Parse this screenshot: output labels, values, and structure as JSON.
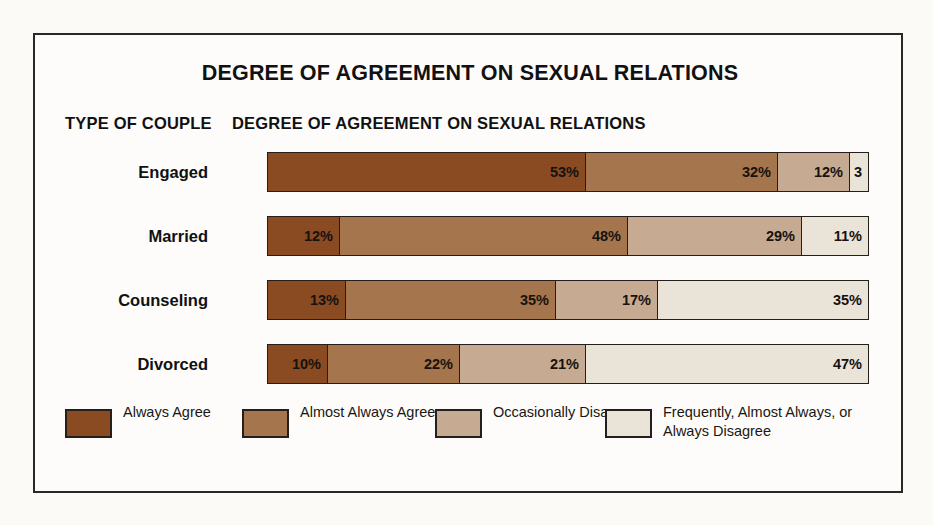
{
  "chart_data": {
    "type": "bar",
    "orientation": "horizontal",
    "stacked": true,
    "normalized_percent": true,
    "title": "DEGREE OF AGREEMENT ON SEXUAL RELATIONS",
    "xlabel": "DEGREE OF AGREEMENT ON SEXUAL RELATIONS",
    "ylabel": "TYPE OF COUPLE",
    "grid": false,
    "legend_position": "bottom",
    "xlim": [
      0,
      100
    ],
    "categories": [
      "Engaged",
      "Married",
      "Counseling",
      "Divorced"
    ],
    "series": [
      {
        "name": "Always Agree",
        "color": "#8a4a22",
        "values": [
          53,
          12,
          13,
          10
        ],
        "labels": [
          "53%",
          "12%",
          "13%",
          "10%"
        ]
      },
      {
        "name": "Almost Always Agree",
        "color": "#a5754d",
        "values": [
          32,
          48,
          35,
          22
        ],
        "labels": [
          "32%",
          "48%",
          "35%",
          "22%"
        ]
      },
      {
        "name": "Occasionally Disagree",
        "color": "#c6ab92",
        "values": [
          12,
          29,
          17,
          21
        ],
        "labels": [
          "12%",
          "29%",
          "17%",
          "21%"
        ]
      },
      {
        "name": "Frequently, Almost Always, or Always Disagree",
        "color": "#e9e3d8",
        "values": [
          3,
          11,
          35,
          47
        ],
        "labels": [
          "3",
          "11%",
          "35%",
          "47%"
        ]
      }
    ]
  },
  "header": {
    "title": "DEGREE OF AGREEMENT ON SEXUAL RELATIONS",
    "col_label_left": "TYPE OF COUPLE",
    "col_label_right": "DEGREE OF AGREEMENT ON SEXUAL RELATIONS"
  },
  "rows": [
    {
      "label": "Engaged",
      "segments": [
        {
          "label": "53%",
          "value": 53,
          "color": "#8a4a22"
        },
        {
          "label": "32%",
          "value": 32,
          "color": "#a5754d"
        },
        {
          "label": "12%",
          "value": 12,
          "color": "#c6ab92"
        },
        {
          "label": "3",
          "value": 3,
          "color": "#e9e3d8"
        }
      ]
    },
    {
      "label": "Married",
      "segments": [
        {
          "label": "12%",
          "value": 12,
          "color": "#8a4a22"
        },
        {
          "label": "48%",
          "value": 48,
          "color": "#a5754d"
        },
        {
          "label": "29%",
          "value": 29,
          "color": "#c6ab92"
        },
        {
          "label": "11%",
          "value": 11,
          "color": "#e9e3d8"
        }
      ]
    },
    {
      "label": "Counseling",
      "segments": [
        {
          "label": "13%",
          "value": 13,
          "color": "#8a4a22"
        },
        {
          "label": "35%",
          "value": 35,
          "color": "#a5754d"
        },
        {
          "label": "17%",
          "value": 17,
          "color": "#c6ab92"
        },
        {
          "label": "35%",
          "value": 35,
          "color": "#e9e3d8"
        }
      ]
    },
    {
      "label": "Divorced",
      "segments": [
        {
          "label": "10%",
          "value": 10,
          "color": "#8a4a22"
        },
        {
          "label": "22%",
          "value": 22,
          "color": "#a5754d"
        },
        {
          "label": "21%",
          "value": 21,
          "color": "#c6ab92"
        },
        {
          "label": "47%",
          "value": 47,
          "color": "#e9e3d8"
        }
      ]
    }
  ],
  "legend": [
    {
      "label": "Always Agree",
      "color": "#8a4a22"
    },
    {
      "label": "Almost Always Agree",
      "color": "#a5754d"
    },
    {
      "label": "Occasionally Disagree",
      "color": "#c6ab92"
    },
    {
      "label": "Frequently, Almost Always, or Always Disagree",
      "color": "#e9e3d8"
    }
  ]
}
